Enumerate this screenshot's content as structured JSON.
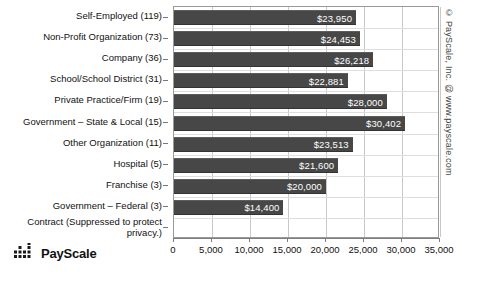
{
  "watermark": {
    "text": "© PayScale, Inc. @ www.payscale.com"
  },
  "logo": {
    "name": "PayScale",
    "icon": "payscale-dot-matrix-icon"
  },
  "colors": {
    "bar": "#474747",
    "bar_label": "#ffffff",
    "grid": "#c9c9c9",
    "axis": "#7d7d7d",
    "text": "#111111",
    "background": "#ffffff"
  },
  "chart_data": {
    "type": "bar",
    "orientation": "horizontal",
    "title": "",
    "subtitle": "",
    "xlabel": "",
    "ylabel": "",
    "xlim": [
      0,
      35000
    ],
    "grid": true,
    "legend": null,
    "xticks": [
      0,
      5000,
      10000,
      15000,
      20000,
      25000,
      30000,
      35000
    ],
    "xtick_labels": [
      "0",
      "5,000",
      "10,000",
      "15,000",
      "20,000",
      "25,000",
      "30,000",
      "35,000"
    ],
    "categories": [
      "Self-Employed (119)",
      "Non-Profit Organization (73)",
      "Company (36)",
      "School/School District (31)",
      "Private Practice/Firm (19)",
      "Government – State & Local (15)",
      "Other Organization (11)",
      "Hospital (5)",
      "Franchise (3)",
      "Government – Federal (3)",
      "Contract (Suppressed to protect privacy.)"
    ],
    "values": [
      23950,
      24453,
      26218,
      22881,
      28000,
      30402,
      23513,
      21600,
      20000,
      14400,
      null
    ],
    "data_labels": [
      "$23,950",
      "$24,453",
      "$26,218",
      "$22,881",
      "$28,000",
      "$30,402",
      "$23,513",
      "$21,600",
      "$20,000",
      "$14,400",
      ""
    ],
    "counts": [
      119,
      73,
      36,
      31,
      19,
      15,
      11,
      5,
      3,
      3,
      null
    ],
    "suppressed_index": 10,
    "suppressed_note": "Contract (Suppressed to protect privacy.)"
  }
}
